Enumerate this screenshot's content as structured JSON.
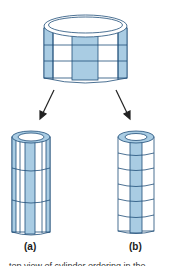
{
  "figure": {
    "colors": {
      "shade": "#a9cce3",
      "outline": "#1f4e79",
      "white": "#ffffff",
      "arrow": "#222222"
    },
    "top_cylinder": {
      "rows": 3,
      "shaded_columns": "alternating wide blocks"
    },
    "panels": [
      {
        "id": "a",
        "label": "(a)",
        "rows": 3
      },
      {
        "id": "b",
        "label": "(b)",
        "rows": 6
      }
    ],
    "caption_partial": "…top view of cylinder ordering in the…"
  }
}
